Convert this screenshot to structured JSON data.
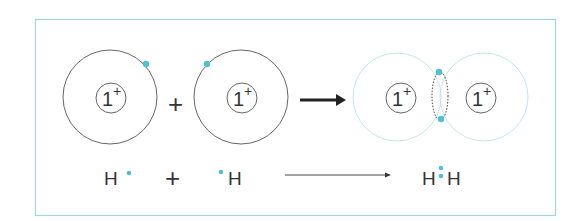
{
  "diagram": {
    "colors": {
      "frame": "#9fd6dc",
      "electron": "#4ebfd6",
      "shell_left": "#555555",
      "shell_bonded": "#b8e4e8",
      "text": "#333333"
    },
    "atoms": [
      {
        "nucleus_label": "1",
        "charge": "+"
      },
      {
        "nucleus_label": "1",
        "charge": "+"
      }
    ],
    "molecule": {
      "nuclei": [
        {
          "nucleus_label": "1",
          "charge": "+"
        },
        {
          "nucleus_label": "1",
          "charge": "+"
        }
      ]
    },
    "operators": {
      "plus": "+"
    },
    "equation": {
      "reactant_1": "H",
      "reactant_2": "H",
      "plus": "+",
      "product_left": "H",
      "product_right": "H"
    }
  }
}
